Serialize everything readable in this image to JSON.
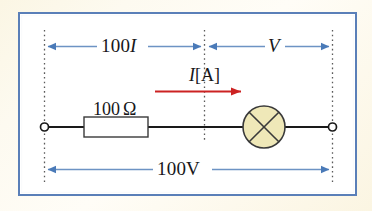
{
  "figure": {
    "type": "circuit-diagram",
    "frame_color": "#5a7fb8",
    "page_background": "#fbf6e4",
    "panel_background": "#ffffff"
  },
  "dimensions": {
    "left_span_label": "100I",
    "left_span_text_main": "100",
    "left_span_text_italic": "I",
    "right_span_label": "V",
    "total_span_label": "100V",
    "total_span_text_main": "100",
    "total_span_text_upright": "V",
    "arrow_color": "#4a7ab8",
    "guide_line_color": "#5b5b5b"
  },
  "current": {
    "symbol": "I",
    "unit_label": "[A]",
    "arrow_color": "#cc2222",
    "direction": "left-to-right"
  },
  "components": {
    "resistor": {
      "label_value": "100",
      "label_unit": "Ω",
      "label_full": "100 Ω",
      "body_fill": "#ffffff",
      "body_stroke": "#3a3a3a"
    },
    "lamp": {
      "symbol": "crossed-circle",
      "fill": "#efe8b8",
      "stroke": "#3a3a3a"
    },
    "terminals": {
      "left": "open-node",
      "right": "open-node"
    },
    "wire_color": "#1a1a1a"
  }
}
